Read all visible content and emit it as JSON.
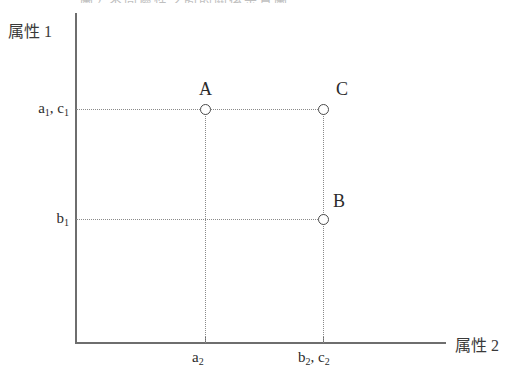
{
  "figure": {
    "caption_cutoff": "圖2 不同屬性之間的關係示意圖",
    "background_color": "#ffffff",
    "axis_color": "#6e6e6e",
    "guide_color": "#8a8a8a",
    "marker_color": "#4a4a4a"
  },
  "axes": {
    "y_title": "属性 1",
    "x_title": "属性 2"
  },
  "chart_data": {
    "type": "scatter",
    "title": "",
    "xlabel": "属性 2",
    "ylabel": "属性 1",
    "y_ticks": [
      {
        "label_html": "b<sub>1</sub>",
        "label_text": "b1",
        "pixel_y": 219
      },
      {
        "label_html": "a<sub>1</sub>, c<sub>1</sub>",
        "label_text": "a1, c1",
        "pixel_y": 109
      }
    ],
    "x_ticks": [
      {
        "label_html": "a<sub>2</sub>",
        "label_text": "a2",
        "pixel_x": 205
      },
      {
        "label_html": "b<sub>2</sub>, c<sub>2</sub>",
        "label_text": "b2, c2",
        "pixel_x": 323
      }
    ],
    "points": [
      {
        "name": "A",
        "x_tick": "a2",
        "y_tick": "a1",
        "marker": "open-circle"
      },
      {
        "name": "B",
        "x_tick": "b2",
        "y_tick": "b1",
        "marker": "open-circle"
      },
      {
        "name": "C",
        "x_tick": "c2",
        "y_tick": "c1",
        "marker": "open-circle"
      }
    ],
    "grid": false,
    "legend": "none"
  }
}
